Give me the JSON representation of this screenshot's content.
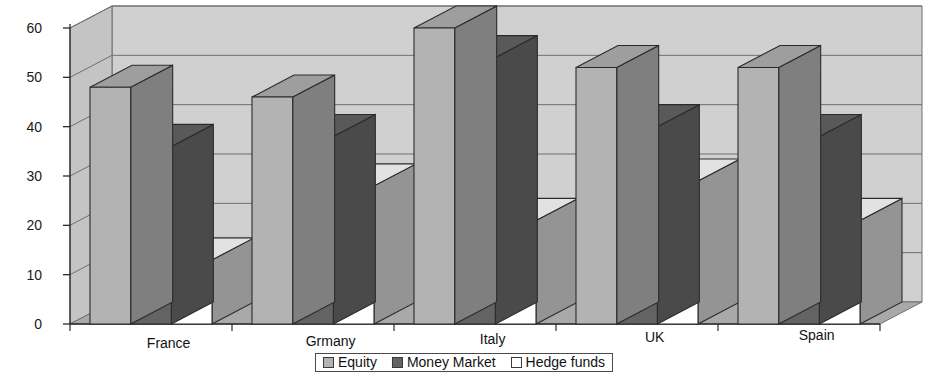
{
  "chart_data": {
    "type": "bar",
    "title": "",
    "subtitle": "",
    "xlabel": "",
    "ylabel": "",
    "categories": [
      "France",
      "Grmany",
      "Italy",
      "UK",
      "Spain"
    ],
    "series": [
      {
        "name": "Equity",
        "color": "#b3b3b3",
        "values": [
          48,
          46,
          60,
          52,
          52
        ]
      },
      {
        "name": "Money Market",
        "color": "#636363",
        "values": [
          36,
          38,
          54,
          40,
          38
        ]
      },
      {
        "name": "Hedge funds",
        "color": "#ffffff",
        "values": [
          13,
          28,
          21,
          29,
          21
        ]
      }
    ],
    "ylim": [
      0,
      60
    ],
    "yticks": [
      0,
      10,
      20,
      30,
      40,
      50,
      60
    ],
    "ytick_labels": [
      "0",
      "10",
      "20",
      "30",
      "40",
      "50",
      "60"
    ],
    "grid": true,
    "grid_axis": "y",
    "legend_position": "bottom",
    "three_d": true,
    "style": "grayscale-scanned"
  },
  "legend": {
    "items": [
      {
        "label": "Equity",
        "color": "#b3b3b3"
      },
      {
        "label": "Money Market",
        "color": "#636363"
      },
      {
        "label": "Hedge funds",
        "color": "#ffffff"
      }
    ]
  },
  "axes": {
    "y": {
      "labels": [
        "60",
        "50",
        "40",
        "30",
        "20",
        "10",
        "0"
      ]
    },
    "x": {
      "labels": [
        "France",
        "Grmany",
        "Italy",
        "UK",
        "Spain"
      ]
    }
  },
  "colors": {
    "back_wall": "#d0d0d0",
    "side_wall": "#c4c4c4",
    "floor": "#a9a9a9",
    "grid_line": "#6f6f6f",
    "outline": "#2b2b2b",
    "equity_front": "#b3b3b3",
    "equity_side": "#7f7f7f",
    "equity_top": "#9e9e9e",
    "money_front": "#636363",
    "money_side": "#4a4a4a",
    "money_top": "#595959",
    "hedge_front": "#ffffff",
    "hedge_side": "#949494",
    "hedge_top": "#e2e2e2"
  }
}
